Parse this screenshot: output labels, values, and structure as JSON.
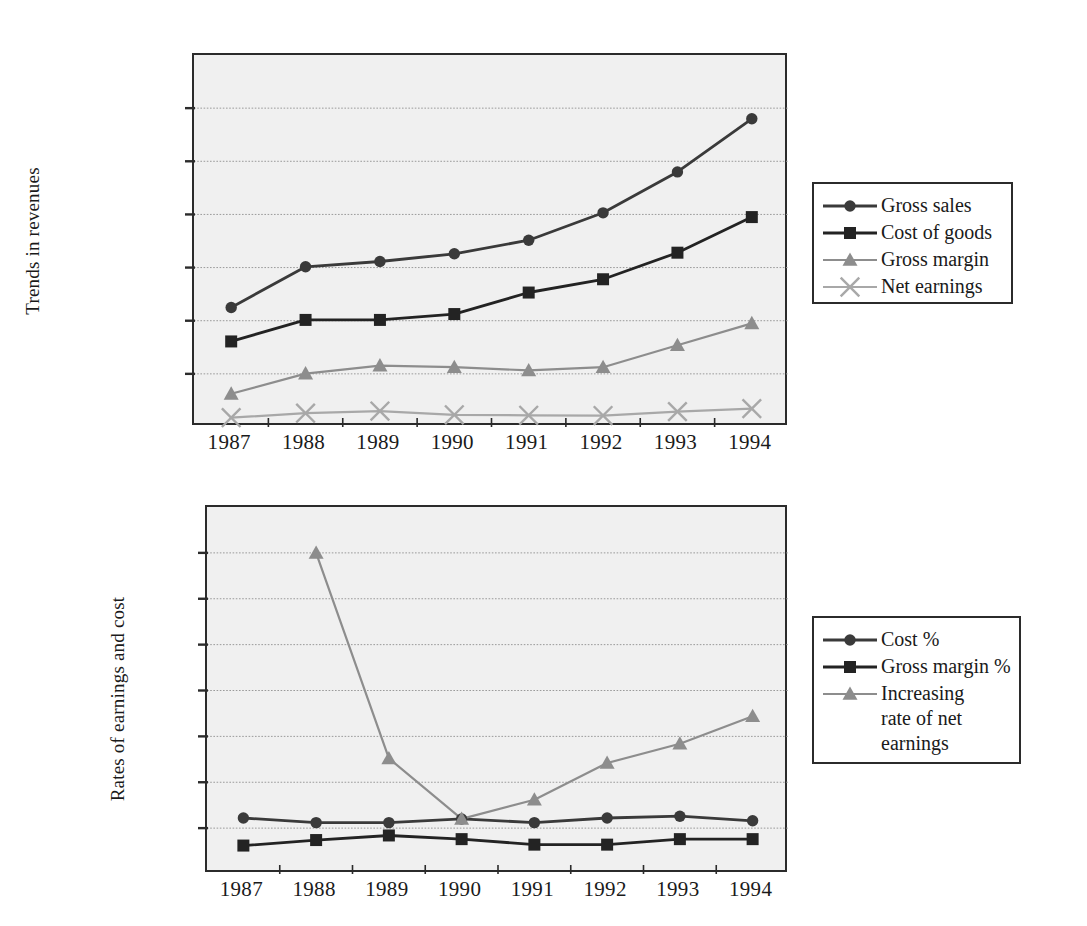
{
  "colors": {
    "series_dark": "#3a3a3a",
    "series_black": "#232323",
    "series_gray": "#8d8d8d",
    "series_lightgray": "#a8a8a8",
    "plot_bg": "#f0f0f0",
    "frame": "#2b2b2b",
    "gridline": "#9a9a9a",
    "text": "#1a1a1a"
  },
  "charts": [
    {
      "id": "revenues",
      "ylabel": "Trends in revenues",
      "legend_items": [
        "Gross sales",
        "Cost of goods",
        "Gross margin",
        "Net earnings"
      ]
    },
    {
      "id": "rates",
      "ylabel": "Rates of earnings and cost",
      "legend_items": [
        "Cost %",
        "Gross margin %",
        "Increasing\nrate of net\nearnings"
      ]
    }
  ],
  "chart_data": [
    {
      "type": "line",
      "title": "",
      "xlabel": "",
      "ylabel": "Trends in revenues",
      "categories": [
        "1987",
        "1988",
        "1989",
        "1990",
        "1991",
        "1992",
        "1993",
        "1994"
      ],
      "x": [
        1987,
        1988,
        1989,
        1990,
        1991,
        1992,
        1993,
        1994
      ],
      "ylim": [
        0,
        14000000
      ],
      "yticks": [
        0,
        2000000,
        4000000,
        6000000,
        8000000,
        10000000,
        12000000,
        14000000
      ],
      "ytick_labels": [
        "0",
        "2,000,000",
        "4,000,000",
        "6,000,000",
        "8,000,000",
        "10,000,000",
        "12,000,000",
        "14,000,000"
      ],
      "grid": true,
      "legend_position": "right",
      "series": [
        {
          "name": "Gross sales",
          "marker": "circle",
          "color": "#3a3a3a",
          "values": [
            4500000,
            6030000,
            6230000,
            6520000,
            7030000,
            8060000,
            9600000,
            11600000
          ]
        },
        {
          "name": "Cost of goods",
          "marker": "square",
          "color": "#232323",
          "values": [
            3220000,
            4030000,
            4030000,
            4250000,
            5060000,
            5560000,
            6560000,
            7900000
          ]
        },
        {
          "name": "Gross margin",
          "marker": "triangle",
          "color": "#8d8d8d",
          "values": [
            1250000,
            2010000,
            2310000,
            2250000,
            2130000,
            2250000,
            3080000,
            3900000
          ]
        },
        {
          "name": "Net earnings",
          "marker": "cross",
          "color": "#a8a8a8",
          "values": [
            350000,
            520000,
            600000,
            460000,
            440000,
            430000,
            580000,
            690000
          ]
        }
      ]
    },
    {
      "type": "line",
      "title": "",
      "xlabel": "",
      "ylabel": "Rates of earnings and cost",
      "categories": [
        "1987",
        "1988",
        "1989",
        "1990",
        "1991",
        "1992",
        "1993",
        "1994"
      ],
      "x": [
        1987,
        1988,
        1989,
        1990,
        1991,
        1992,
        1993,
        1994
      ],
      "ylim": [
        0,
        4
      ],
      "yticks": [
        0,
        0.5,
        1,
        1.5,
        2,
        2.5,
        3,
        3.5,
        4
      ],
      "ytick_labels": [
        "0",
        "0.5",
        "1",
        "1.5",
        "2",
        "2.5",
        "3",
        "3.5",
        "4"
      ],
      "grid": true,
      "legend_position": "right",
      "series": [
        {
          "name": "Cost %",
          "marker": "circle",
          "color": "#3a3a3a",
          "values": [
            0.61,
            0.56,
            0.56,
            0.6,
            0.56,
            0.61,
            0.63,
            0.58
          ]
        },
        {
          "name": "Gross margin %",
          "marker": "square",
          "color": "#232323",
          "values": [
            0.31,
            0.37,
            0.42,
            0.38,
            0.32,
            0.32,
            0.38,
            0.38
          ]
        },
        {
          "name": "Increasing rate of net earnings",
          "marker": "triangle",
          "color": "#8d8d8d",
          "values": [
            null,
            3.5,
            1.26,
            0.6,
            0.81,
            1.21,
            1.42,
            1.72
          ]
        }
      ]
    }
  ]
}
